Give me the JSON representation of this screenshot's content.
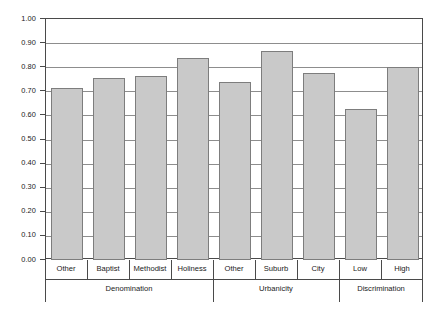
{
  "chart_data": {
    "type": "bar",
    "title": "",
    "subtitle": "",
    "xlabel": "",
    "ylabel": "",
    "ylim": [
      0.0,
      1.0
    ],
    "grid": true,
    "legend": null,
    "y_ticks": [
      "0.00",
      "0.10",
      "0.20",
      "0.30",
      "0.40",
      "0.50",
      "0.60",
      "0.70",
      "0.80",
      "0.90",
      "1.00"
    ],
    "y_tick_values": [
      0.0,
      0.1,
      0.2,
      0.3,
      0.4,
      0.5,
      0.6,
      0.7,
      0.8,
      0.9,
      1.0
    ],
    "categories": [
      "Other",
      "Baptist",
      "Methodist",
      "Holiness",
      "Other",
      "Suburb",
      "City",
      "Low",
      "High"
    ],
    "values": [
      0.715,
      0.757,
      0.765,
      0.838,
      0.738,
      0.868,
      0.775,
      0.625,
      0.8
    ],
    "groups": [
      {
        "label": "Denomination",
        "categories": [
          "Other",
          "Baptist",
          "Methodist",
          "Holiness"
        ]
      },
      {
        "label": "Urbanicity",
        "categories": [
          "Other",
          "Suburb",
          "City"
        ]
      },
      {
        "label": "Discrimination",
        "categories": [
          "Low",
          "High"
        ]
      }
    ],
    "bar_color": "#c9c9c9",
    "bar_border_color": "#7d7d7d",
    "grid_color": "#8d8d8d",
    "axis_color": "#4a4a4a"
  }
}
